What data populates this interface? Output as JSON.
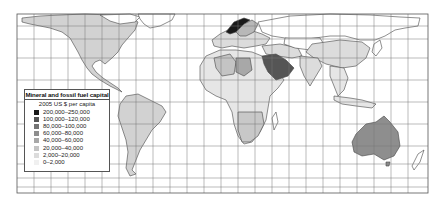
{
  "map": {
    "type": "choropleth world map",
    "projection": "equirectangular with graticule",
    "frame": {
      "x": 17,
      "y": 14,
      "width": 411,
      "height": 179
    },
    "graticule": {
      "vertical_lines_x": [
        17,
        34,
        51,
        68,
        85,
        102,
        119,
        136,
        153,
        170,
        187,
        204,
        221,
        238,
        255,
        272,
        289,
        306,
        323,
        340,
        357,
        374,
        391,
        408,
        428
      ],
      "horizontal_lines_y": [
        14,
        26,
        39,
        58,
        80,
        102,
        124,
        146,
        164,
        178,
        187,
        193
      ]
    },
    "colors": {
      "border": "#555555",
      "grid": "#777777",
      "land_outline": "#444444",
      "no_data": "#ffffff"
    }
  },
  "legend": {
    "title": "Mineral and fossil fuel capital",
    "subtitle": "2005 US $ per capita",
    "items": [
      {
        "label": "200,000–250,000",
        "color": "#1a1a1a"
      },
      {
        "label": "100,000–120,000",
        "color": "#555555"
      },
      {
        "label": "80,000–100,000",
        "color": "#747474"
      },
      {
        "label": "60,000–80,000",
        "color": "#8e8e8e"
      },
      {
        "label": "40,000–60,000",
        "color": "#a8a8a8"
      },
      {
        "label": "20,000–40,000",
        "color": "#c4c4c4"
      },
      {
        "label": "2,000–20,000",
        "color": "#dcdcdc"
      },
      {
        "label": "0–2,000",
        "color": "#f0f0f0"
      }
    ]
  },
  "regions": [
    {
      "name": "Canada",
      "class": "20,000–40,000"
    },
    {
      "name": "United States",
      "class": "20,000–40,000"
    },
    {
      "name": "Mexico",
      "class": "20,000–40,000"
    },
    {
      "name": "South America",
      "class": "20,000–40,000"
    },
    {
      "name": "Norway",
      "class": "200,000–250,000"
    },
    {
      "name": "Europe",
      "class": "2,000–20,000"
    },
    {
      "name": "Russia",
      "class": "20,000–40,000"
    },
    {
      "name": "Algeria",
      "class": "20,000–40,000"
    },
    {
      "name": "Libya",
      "class": "40,000–60,000"
    },
    {
      "name": "Saudi Arabia",
      "class": "100,000–120,000"
    },
    {
      "name": "Southern Africa",
      "class": "20,000–40,000"
    },
    {
      "name": "China",
      "class": "2,000–20,000"
    },
    {
      "name": "India",
      "class": "2,000–20,000"
    },
    {
      "name": "Australia",
      "class": "60,000–80,000"
    }
  ]
}
